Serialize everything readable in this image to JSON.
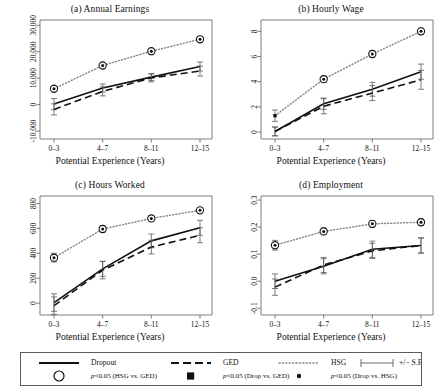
{
  "figure": {
    "xlabel": "Potential Experience (Years)",
    "categories": [
      "0–3",
      "4–7",
      "8–11",
      "12–15"
    ]
  },
  "legend": {
    "dropout_label": "Dropout",
    "ged_label": "GED",
    "hsg_label": "HSG",
    "se_label": "+/− S.E.",
    "sig_hsg_ged": "p<0.05 (HSG vs. GED)",
    "sig_drop_ged": "p<0.05 (Drop vs. GED)",
    "sig_drop_hsg": "p<0.05 (Drop vs. HSG)",
    "p_prefix": "p",
    "sig_hsg_ged_rest": "<0.05 (HSG vs. GED)",
    "sig_drop_ged_rest": "<0.05 (Drop vs. GED)",
    "sig_drop_hsg_rest": "<0.05 (Drop vs. HSG)"
  },
  "colors": {
    "line": "#111111",
    "hsg_dotted": "#8a8a8a",
    "axis": "#5b5b5b"
  },
  "chart_data": [
    {
      "id": "a",
      "type": "line",
      "title": "(a) Annual Earnings",
      "xlabel": "Potential Experience (Years)",
      "ylabel": "",
      "categories": [
        "0–3",
        "4–7",
        "8–11",
        "12–15"
      ],
      "yticks": [
        -10000,
        0,
        10000,
        20000,
        30000
      ],
      "yticklabels": [
        "-10,000",
        "0",
        "10,000",
        "20,000",
        "30,000"
      ],
      "ylim": [
        -13000,
        32000
      ],
      "grid": false,
      "legend_position": "below-figure",
      "series": [
        {
          "name": "Dropout",
          "style": "solid",
          "values": [
            200,
            6300,
            10400,
            14400
          ],
          "se": [
            2100,
            1500,
            1300,
            1700
          ]
        },
        {
          "name": "GED",
          "style": "dashed",
          "values": [
            -1800,
            5000,
            10100,
            12700
          ],
          "se": [
            2100,
            1700,
            1500,
            1900
          ]
        },
        {
          "name": "HSG",
          "style": "dotted",
          "values": [
            6000,
            14800,
            20200,
            24700
          ],
          "se": [
            600,
            500,
            500,
            600
          ]
        }
      ],
      "sig_markers": [
        {
          "series": "HSG",
          "x": "0–3",
          "marks": [
            "circle",
            "dot"
          ]
        },
        {
          "series": "HSG",
          "x": "4–7",
          "marks": [
            "circle",
            "dot"
          ]
        },
        {
          "series": "HSG",
          "x": "8–11",
          "marks": [
            "circle",
            "dot"
          ]
        },
        {
          "series": "HSG",
          "x": "12–15",
          "marks": [
            "circle",
            "dot"
          ]
        }
      ]
    },
    {
      "id": "b",
      "type": "line",
      "title": "(b) Hourly Wage",
      "xlabel": "Potential Experience (Years)",
      "ylabel": "",
      "categories": [
        "0–3",
        "4–7",
        "8–11",
        "12–15"
      ],
      "yticks": [
        0,
        2,
        4,
        6,
        8
      ],
      "yticklabels": [
        "0",
        "2",
        "4",
        "6",
        "8"
      ],
      "ylim": [
        -0.55,
        8.9
      ],
      "grid": false,
      "legend_position": "below-figure",
      "series": [
        {
          "name": "Dropout",
          "style": "solid",
          "values": [
            0.05,
            2.25,
            3.4,
            4.8
          ],
          "se": [
            0.35,
            0.45,
            0.55,
            0.6
          ]
        },
        {
          "name": "GED",
          "style": "dashed",
          "values": [
            0.05,
            2.05,
            3.1,
            4.15
          ],
          "se": [
            0.35,
            0.6,
            0.6,
            0.75
          ]
        },
        {
          "name": "HSG",
          "style": "dotted",
          "values": [
            1.3,
            4.2,
            6.2,
            8.0
          ],
          "se": [
            0.45,
            0.25,
            0.25,
            0.25
          ]
        }
      ],
      "sig_markers": [
        {
          "series": "HSG",
          "x": "0–3",
          "marks": [
            "square"
          ]
        },
        {
          "series": "HSG",
          "x": "4–7",
          "marks": [
            "circle",
            "dot"
          ]
        },
        {
          "series": "HSG",
          "x": "8–11",
          "marks": [
            "circle",
            "dot"
          ]
        },
        {
          "series": "HSG",
          "x": "12–15",
          "marks": [
            "circle",
            "dot"
          ]
        }
      ]
    },
    {
      "id": "c",
      "type": "line",
      "title": "(c) Hours Worked",
      "xlabel": "Potential Experience (Years)",
      "ylabel": "",
      "categories": [
        "0–3",
        "4–7",
        "8–11",
        "12–15"
      ],
      "yticks": [
        0,
        200,
        400,
        600,
        800
      ],
      "yticklabels": [
        "0",
        "200",
        "400",
        "600",
        "800"
      ],
      "ylim": [
        -95,
        860
      ],
      "grid": false,
      "legend_position": "below-figure",
      "series": [
        {
          "name": "Dropout",
          "style": "solid",
          "values": [
            5,
            275,
            500,
            605
          ],
          "se": [
            70,
            60,
            55,
            60
          ]
        },
        {
          "name": "GED",
          "style": "dashed",
          "values": [
            -20,
            265,
            450,
            545
          ],
          "se": [
            70,
            70,
            55,
            60
          ]
        },
        {
          "name": "HSG",
          "style": "dotted",
          "values": [
            365,
            595,
            680,
            745
          ],
          "se": [
            35,
            25,
            20,
            20
          ]
        }
      ],
      "sig_markers": [
        {
          "series": "HSG",
          "x": "0–3",
          "marks": [
            "circle",
            "dot"
          ]
        },
        {
          "series": "HSG",
          "x": "4–7",
          "marks": [
            "circle",
            "dot"
          ]
        },
        {
          "series": "HSG",
          "x": "8–11",
          "marks": [
            "circle",
            "dot"
          ]
        },
        {
          "series": "HSG",
          "x": "12–15",
          "marks": [
            "circle",
            "dot"
          ]
        }
      ]
    },
    {
      "id": "d",
      "type": "line",
      "title": "(d) Employment",
      "xlabel": "Potential Experience (Years)",
      "ylabel": "",
      "categories": [
        "0–3",
        "4–7",
        "8–11",
        "12–15"
      ],
      "yticks": [
        -0.1,
        0.0,
        0.1,
        0.2,
        0.3
      ],
      "yticklabels": [
        "-0.1",
        "0.0",
        "0.1",
        "0.2",
        "0.3"
      ],
      "ylim": [
        -0.125,
        0.315
      ],
      "grid": false,
      "legend_position": "below-figure",
      "series": [
        {
          "name": "Dropout",
          "style": "solid",
          "values": [
            0.0,
            0.055,
            0.118,
            0.132
          ],
          "se": [
            0.027,
            0.028,
            0.03,
            0.028
          ]
        },
        {
          "name": "GED",
          "style": "dashed",
          "values": [
            -0.022,
            0.06,
            0.112,
            0.132
          ],
          "se": [
            0.03,
            0.028,
            0.028,
            0.028
          ]
        },
        {
          "name": "HSG",
          "style": "dotted",
          "values": [
            0.133,
            0.184,
            0.212,
            0.218
          ],
          "se": [
            0.018,
            0.012,
            0.012,
            0.012
          ]
        }
      ],
      "sig_markers": [
        {
          "series": "HSG",
          "x": "0–3",
          "marks": [
            "circle",
            "dot"
          ]
        },
        {
          "series": "HSG",
          "x": "4–7",
          "marks": [
            "circle",
            "dot"
          ]
        },
        {
          "series": "HSG",
          "x": "8–11",
          "marks": [
            "circle",
            "dot"
          ]
        },
        {
          "series": "HSG",
          "x": "12–15",
          "marks": [
            "circle",
            "dot"
          ]
        }
      ]
    }
  ]
}
